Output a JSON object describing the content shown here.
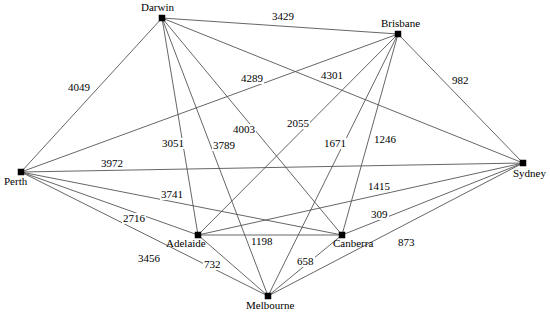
{
  "chart_data": {
    "type": "diagram",
    "subtype": "weighted-complete-graph",
    "title": "",
    "node_count": 7,
    "edge_count": 21,
    "units": "km",
    "nodes": [
      {
        "id": "darwin",
        "label": "Darwin",
        "x": 162,
        "y": 18,
        "label_x": 141,
        "label_y": 2,
        "label_align": "center"
      },
      {
        "id": "brisbane",
        "label": "Brisbane",
        "x": 398,
        "y": 34,
        "label_x": 381,
        "label_y": 18,
        "label_align": "center"
      },
      {
        "id": "perth",
        "label": "Perth",
        "x": 21,
        "y": 172,
        "label_x": 4,
        "label_y": 176,
        "label_align": "left"
      },
      {
        "id": "sydney",
        "label": "Sydney",
        "x": 523,
        "y": 163,
        "label_x": 513,
        "label_y": 168,
        "label_align": "left"
      },
      {
        "id": "adelaide",
        "label": "Adelaide",
        "x": 198,
        "y": 235,
        "label_x": 166,
        "label_y": 238,
        "label_align": "left"
      },
      {
        "id": "canberra",
        "label": "Canberra",
        "x": 342,
        "y": 235,
        "label_x": 333,
        "label_y": 238,
        "label_align": "left"
      },
      {
        "id": "melbourne",
        "label": "Melbourne",
        "x": 268,
        "y": 296,
        "label_x": 246,
        "label_y": 300,
        "label_align": "center"
      }
    ],
    "edges": [
      {
        "id": "darwin-brisbane",
        "source": "darwin",
        "target": "brisbane",
        "weight": 3429,
        "label_x": 271,
        "label_y": 11
      },
      {
        "id": "darwin-perth",
        "source": "darwin",
        "target": "perth",
        "weight": 4049,
        "label_x": 67,
        "label_y": 82
      },
      {
        "id": "darwin-sydney",
        "source": "darwin",
        "target": "sydney",
        "weight": 4289,
        "label_x": 240,
        "label_y": 73
      },
      {
        "id": "darwin-canberra",
        "source": "darwin",
        "target": "canberra",
        "weight": 4003,
        "label_x": 232,
        "label_y": 124
      },
      {
        "id": "darwin-adelaide",
        "source": "darwin",
        "target": "adelaide",
        "weight": 3051,
        "label_x": 161,
        "label_y": 138
      },
      {
        "id": "darwin-melbourne",
        "source": "darwin",
        "target": "melbourne",
        "weight": 3789,
        "label_x": 212,
        "label_y": 140
      },
      {
        "id": "brisbane-sydney",
        "source": "brisbane",
        "target": "sydney",
        "weight": 982,
        "label_x": 451,
        "label_y": 75
      },
      {
        "id": "brisbane-perth",
        "source": "brisbane",
        "target": "perth",
        "weight": 4301,
        "label_x": 320,
        "label_y": 70
      },
      {
        "id": "brisbane-adelaide",
        "source": "brisbane",
        "target": "adelaide",
        "weight": 2055,
        "label_x": 286,
        "label_y": 118
      },
      {
        "id": "brisbane-melbourne",
        "source": "brisbane",
        "target": "melbourne",
        "weight": 1671,
        "label_x": 323,
        "label_y": 138
      },
      {
        "id": "brisbane-canberra",
        "source": "brisbane",
        "target": "canberra",
        "weight": 1246,
        "label_x": 373,
        "label_y": 134
      },
      {
        "id": "perth-sydney",
        "source": "perth",
        "target": "sydney",
        "weight": 3972,
        "label_x": 100,
        "label_y": 158
      },
      {
        "id": "perth-canberra",
        "source": "perth",
        "target": "canberra",
        "weight": 3741,
        "label_x": 160,
        "label_y": 189
      },
      {
        "id": "perth-adelaide",
        "source": "perth",
        "target": "adelaide",
        "weight": 2716,
        "label_x": 122,
        "label_y": 213
      },
      {
        "id": "perth-melbourne",
        "source": "perth",
        "target": "melbourne",
        "weight": 3456,
        "label_x": 137,
        "label_y": 253
      },
      {
        "id": "sydney-adelaide",
        "source": "sydney",
        "target": "adelaide",
        "weight": 1415,
        "label_x": 367,
        "label_y": 181
      },
      {
        "id": "sydney-canberra",
        "source": "sydney",
        "target": "canberra",
        "weight": 309,
        "label_x": 370,
        "label_y": 209
      },
      {
        "id": "sydney-melbourne",
        "source": "sydney",
        "target": "melbourne",
        "weight": 873,
        "label_x": 397,
        "label_y": 237
      },
      {
        "id": "adelaide-canberra",
        "source": "adelaide",
        "target": "canberra",
        "weight": 1198,
        "label_x": 250,
        "label_y": 236
      },
      {
        "id": "adelaide-melbourne",
        "source": "adelaide",
        "target": "melbourne",
        "weight": 732,
        "label_x": 203,
        "label_y": 259
      },
      {
        "id": "canberra-melbourne",
        "source": "canberra",
        "target": "melbourne",
        "weight": 658,
        "label_x": 296,
        "label_y": 256
      }
    ]
  }
}
